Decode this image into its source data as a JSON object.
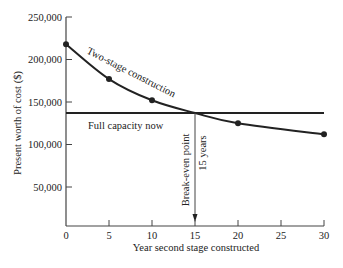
{
  "chart_data": {
    "type": "line",
    "title": "",
    "xlabel": "Year second stage constructed",
    "ylabel": "Present worth of cost ($)",
    "xlim": [
      0,
      30
    ],
    "ylim": [
      0,
      250000
    ],
    "xticks": [
      0,
      5,
      10,
      15,
      20,
      25,
      30
    ],
    "yticks": [
      50000,
      100000,
      150000,
      200000,
      250000
    ],
    "xtick_labels": [
      "0",
      "5",
      "10",
      "15",
      "20",
      "25",
      "30"
    ],
    "ytick_labels": [
      "50,000",
      "100,000",
      "150,000",
      "200,000",
      "250,000"
    ],
    "grid": false,
    "series": [
      {
        "name": "Two-stage construction",
        "x": [
          0,
          5,
          10,
          15,
          20,
          30
        ],
        "y": [
          218000,
          177000,
          152000,
          137000,
          125000,
          112000
        ],
        "markers": [
          0,
          5,
          10,
          20,
          30
        ]
      },
      {
        "name": "Full capacity now",
        "x": [
          0,
          30
        ],
        "y": [
          137000,
          137000
        ]
      }
    ],
    "annotations": [
      {
        "text": "Break-even point",
        "x": 15
      },
      {
        "text": "15 years",
        "x": 15
      }
    ]
  },
  "labels": {
    "two_stage": "Two-stage construction",
    "full_capacity": "Full capacity now",
    "break_even": "Break-even point",
    "years": "15 years"
  },
  "colors": {
    "ink": "#222222",
    "thin": "#444444"
  }
}
